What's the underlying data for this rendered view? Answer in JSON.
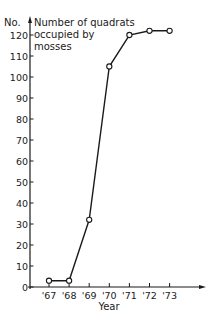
{
  "chart_data": {
    "type": "line",
    "title": "",
    "ylabel": "Number of quadrats occupied by mosses",
    "ylabel_prefix": "No.",
    "ylabel_lines": [
      "Number of quadrats",
      "occupied by",
      "mosses"
    ],
    "xlabel": "Year",
    "categories": [
      "'67",
      "'68",
      "'69",
      "'70",
      "'71",
      "'72",
      "'73"
    ],
    "series": [
      {
        "name": "Number of quadrats occupied by mosses",
        "values": [
          3,
          3,
          32,
          105,
          120,
          122,
          122
        ]
      }
    ],
    "ylim": [
      0,
      120
    ],
    "yticks": [
      0,
      10,
      20,
      30,
      40,
      50,
      60,
      70,
      80,
      90,
      100,
      110,
      120
    ],
    "grid": false,
    "legend": null,
    "marker": "open-circle",
    "line_color": "#1a1a1a"
  }
}
